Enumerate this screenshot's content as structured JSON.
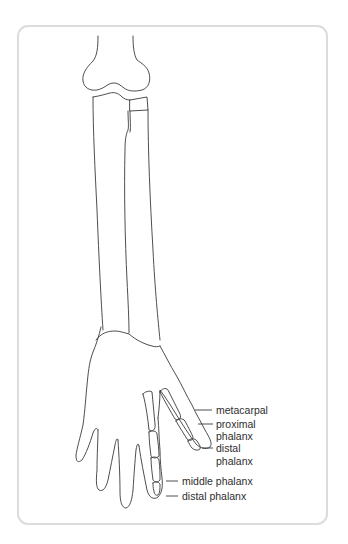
{
  "diagram": {
    "frame": {
      "border_color": "#dcdcdc",
      "line_color": "#3a3a3a"
    },
    "labels": {
      "metacarpal": "metacarpal",
      "proximal_phalanx_line1": "proximal",
      "proximal_phalanx_line2": "phalanx",
      "distal_phalanx_thumb_line1": "distal",
      "distal_phalanx_thumb_line2": "phalanx",
      "middle_phalanx": "middle phalanx",
      "distal_phalanx": "distal phalanx"
    }
  }
}
